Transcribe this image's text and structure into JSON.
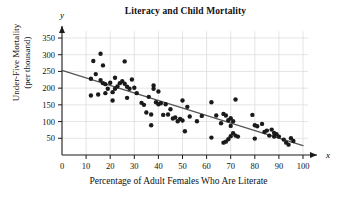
{
  "chart_data": {
    "type": "scatter",
    "title": "Literacy and Child Mortality",
    "xlabel": "Percentage of Adult Females Who Are Literate",
    "ylabel_line1": "Under-Five Mortality",
    "ylabel_line2": "(per thousand)",
    "x_axis_variable": "x",
    "y_axis_variable": "y",
    "xlim": [
      0,
      103
    ],
    "ylim": [
      0,
      370
    ],
    "xticks": [
      0,
      10,
      20,
      30,
      40,
      50,
      60,
      70,
      80,
      90,
      100
    ],
    "yticks": [
      50,
      100,
      150,
      200,
      250,
      300,
      350
    ],
    "grid": "light gray vertical and horizontal gridlines at tick positions",
    "legend": "none",
    "point_color": "#1a1a1a",
    "point_radius": 2.2,
    "trendline": {
      "label": "least-squares regression line",
      "color": "#555555",
      "x_start": 0,
      "y_start": 253,
      "x_end": 100,
      "y_end": 28,
      "slope": -2.25,
      "intercept": 253
    },
    "points": [
      [
        12,
        228
      ],
      [
        12,
        178
      ],
      [
        13,
        281
      ],
      [
        14,
        242
      ],
      [
        15,
        181
      ],
      [
        16,
        303
      ],
      [
        16,
        224
      ],
      [
        17,
        215
      ],
      [
        17,
        268
      ],
      [
        18,
        212
      ],
      [
        18,
        185
      ],
      [
        19,
        198
      ],
      [
        20,
        216
      ],
      [
        21,
        163
      ],
      [
        21,
        188
      ],
      [
        22,
        231
      ],
      [
        22,
        198
      ],
      [
        23,
        205
      ],
      [
        24,
        215
      ],
      [
        25,
        221
      ],
      [
        26,
        280
      ],
      [
        26,
        213
      ],
      [
        27,
        204
      ],
      [
        27,
        171
      ],
      [
        28,
        198
      ],
      [
        29,
        226
      ],
      [
        30,
        201
      ],
      [
        31,
        185
      ],
      [
        33,
        156
      ],
      [
        34,
        150
      ],
      [
        35,
        127
      ],
      [
        36,
        174
      ],
      [
        37,
        121
      ],
      [
        37,
        89
      ],
      [
        38,
        208
      ],
      [
        38,
        198
      ],
      [
        39,
        158
      ],
      [
        40,
        190
      ],
      [
        40,
        152
      ],
      [
        41,
        155
      ],
      [
        42,
        120
      ],
      [
        43,
        152
      ],
      [
        44,
        121
      ],
      [
        45,
        137
      ],
      [
        46,
        109
      ],
      [
        47,
        112
      ],
      [
        48,
        101
      ],
      [
        49,
        108
      ],
      [
        50,
        163
      ],
      [
        50,
        103
      ],
      [
        51,
        71
      ],
      [
        52,
        144
      ],
      [
        53,
        115
      ],
      [
        56,
        101
      ],
      [
        58,
        117
      ],
      [
        62,
        158
      ],
      [
        62,
        52
      ],
      [
        64,
        118
      ],
      [
        66,
        95
      ],
      [
        67,
        123
      ],
      [
        67,
        37
      ],
      [
        68,
        118
      ],
      [
        68,
        40
      ],
      [
        69,
        47
      ],
      [
        69,
        104
      ],
      [
        70,
        110
      ],
      [
        70,
        87
      ],
      [
        70,
        56
      ],
      [
        71,
        101
      ],
      [
        71,
        65
      ],
      [
        72,
        166
      ],
      [
        72,
        58
      ],
      [
        73,
        55
      ],
      [
        79,
        120
      ],
      [
        80,
        49
      ],
      [
        80,
        89
      ],
      [
        81,
        86
      ],
      [
        83,
        93
      ],
      [
        84,
        69
      ],
      [
        85,
        73
      ],
      [
        86,
        58
      ],
      [
        87,
        76
      ],
      [
        88,
        55
      ],
      [
        88,
        66
      ],
      [
        89,
        62
      ],
      [
        90,
        55
      ],
      [
        92,
        46
      ],
      [
        93,
        37
      ],
      [
        94,
        31
      ],
      [
        95,
        50
      ],
      [
        96,
        42
      ]
    ]
  }
}
